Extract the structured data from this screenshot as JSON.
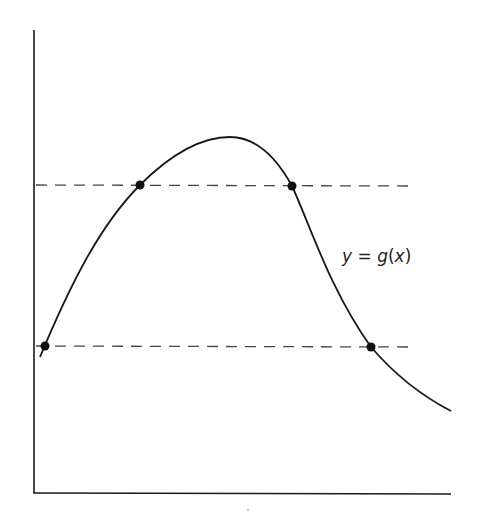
{
  "diagram": {
    "curve_label": {
      "y": "y",
      "eq": " = ",
      "g": "g",
      "open": "(",
      "x": "x",
      "close": ")"
    },
    "full_label": "y = g(x)",
    "dashed_lines": [
      {
        "name": "upper-horizontal-line",
        "y_px": 185
      },
      {
        "name": "lower-horizontal-line",
        "y_px": 346
      }
    ],
    "intersection_points": [
      {
        "name": "upper-left-point",
        "x_px": 140,
        "y_px": 185
      },
      {
        "name": "upper-right-point",
        "x_px": 292,
        "y_px": 186
      },
      {
        "name": "lower-left-point",
        "x_px": 45,
        "y_px": 346
      },
      {
        "name": "lower-right-point",
        "x_px": 371,
        "y_px": 347
      }
    ],
    "colors": {
      "line": "#1a1a1a",
      "dash": "#444444",
      "background": "#ffffff"
    }
  }
}
